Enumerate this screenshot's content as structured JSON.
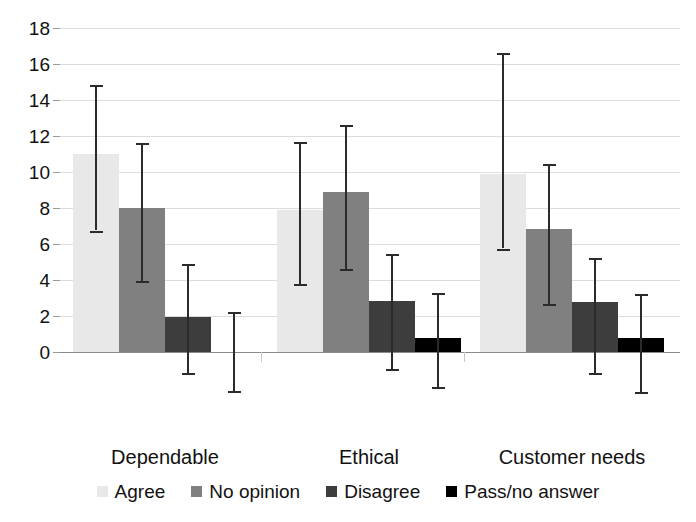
{
  "chart_data": {
    "type": "bar",
    "title": "",
    "xlabel": "",
    "ylabel": "",
    "ylim": [
      -3,
      18
    ],
    "yticks": [
      0,
      2,
      4,
      6,
      8,
      10,
      12,
      14,
      16,
      18
    ],
    "ytick_labels": [
      "0",
      "2",
      "4",
      "6",
      "8",
      "10",
      "12",
      "14",
      "16",
      "18"
    ],
    "grid": true,
    "legend_position": "bottom",
    "categories": [
      "Dependable",
      "Ethical",
      "Customer needs"
    ],
    "series": [
      {
        "name": "Agree",
        "color": "#e8e8e8",
        "values": [
          11.0,
          7.9,
          9.9
        ],
        "err_low": [
          6.75,
          3.8,
          5.75
        ],
        "err_high": [
          14.85,
          11.65,
          16.6
        ]
      },
      {
        "name": "No opinion",
        "color": "#808080",
        "values": [
          8.0,
          8.9,
          6.85
        ],
        "err_low": [
          3.95,
          4.6,
          2.65
        ],
        "err_high": [
          11.6,
          12.6,
          10.45
        ]
      },
      {
        "name": "Disagree",
        "color": "#3d3d3d",
        "values": [
          1.95,
          2.85,
          2.8
        ],
        "err_low": [
          -1.15,
          -0.95,
          -1.15
        ],
        "err_high": [
          4.9,
          5.45,
          5.25
        ]
      },
      {
        "name": "Pass/no answer",
        "color": "#000000",
        "values": [
          0.0,
          0.8,
          0.8
        ],
        "err_low": [
          -2.15,
          -1.95,
          -2.2
        ],
        "err_high": [
          2.2,
          3.3,
          3.25
        ]
      }
    ]
  },
  "axis": {
    "tick_labels": [
      "18",
      "16",
      "14",
      "12",
      "10",
      "8",
      "6",
      "4",
      "2",
      "0"
    ]
  },
  "categories": [
    {
      "label": "Dependable"
    },
    {
      "label": "Ethical"
    },
    {
      "label": "Customer needs"
    }
  ],
  "legend": {
    "items": [
      {
        "label": "Agree",
        "swatch": "agree"
      },
      {
        "label": "No opinion",
        "swatch": "noopinion"
      },
      {
        "label": "Disagree",
        "swatch": "disagree"
      },
      {
        "label": "Pass/no answer",
        "swatch": "pass"
      }
    ]
  }
}
